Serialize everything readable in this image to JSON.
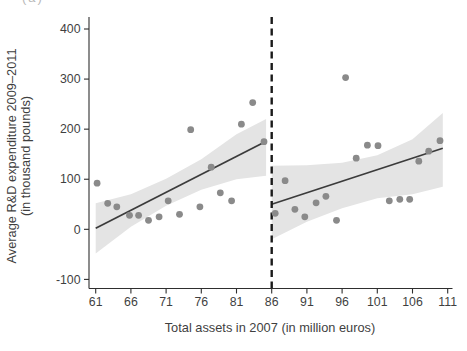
{
  "figure": {
    "panel_label": "(a)"
  },
  "chart_data": {
    "type": "scatter",
    "title": "",
    "xlabel": "Total assets in 2007 (in million euros)",
    "ylabel_line1": "Average R&D expenditure 2009–2011",
    "ylabel_line2": "(in thousand pounds)",
    "xlim": [
      61,
      111
    ],
    "ylim": [
      -100,
      400
    ],
    "x_ticks": [
      61,
      66,
      71,
      76,
      81,
      86,
      91,
      96,
      101,
      106,
      111
    ],
    "y_ticks": [
      400,
      300,
      200,
      100,
      0,
      -100
    ],
    "grid": false,
    "legend": "none",
    "cutoff_x": 86,
    "series": [
      {
        "name": "firms-below-cutoff",
        "points": [
          [
            61.2,
            92
          ],
          [
            62.7,
            52
          ],
          [
            64.0,
            45
          ],
          [
            65.8,
            28
          ],
          [
            67.1,
            28
          ],
          [
            68.5,
            18
          ],
          [
            70.0,
            25
          ],
          [
            71.3,
            57
          ],
          [
            72.9,
            30
          ],
          [
            74.5,
            199
          ],
          [
            75.8,
            45
          ],
          [
            77.4,
            124
          ],
          [
            78.7,
            73
          ],
          [
            80.3,
            57
          ],
          [
            81.7,
            210
          ],
          [
            83.3,
            253
          ],
          [
            84.9,
            175
          ]
        ]
      },
      {
        "name": "firms-above-cutoff",
        "points": [
          [
            86.5,
            32
          ],
          [
            87.9,
            97
          ],
          [
            89.3,
            40
          ],
          [
            90.7,
            25
          ],
          [
            92.3,
            53
          ],
          [
            93.7,
            66
          ],
          [
            95.2,
            18
          ],
          [
            96.5,
            303
          ],
          [
            98.0,
            142
          ],
          [
            99.6,
            168
          ],
          [
            101.1,
            167
          ],
          [
            102.7,
            57
          ],
          [
            104.2,
            60
          ],
          [
            105.6,
            60
          ],
          [
            106.9,
            136
          ],
          [
            108.3,
            156
          ],
          [
            109.9,
            177
          ]
        ]
      }
    ],
    "fit_lines": [
      {
        "name": "fit-below-cutoff",
        "x1": 61,
        "y1": 2,
        "x2": 84.8,
        "y2": 173
      },
      {
        "name": "fit-above-cutoff",
        "x1": 86,
        "y1": 50,
        "x2": 110.3,
        "y2": 162
      }
    ],
    "confidence_bands": [
      {
        "name": "band-below-cutoff",
        "x": [
          61,
          66,
          71,
          76,
          81,
          85.2
        ],
        "top": [
          52,
          70,
          101,
          140,
          190,
          220
        ],
        "bottom": [
          -48,
          5,
          47,
          79,
          100,
          107
        ]
      },
      {
        "name": "band-above-cutoff",
        "x": [
          86,
          91,
          96,
          101,
          106,
          110.3
        ],
        "top": [
          127,
          128,
          133,
          148,
          180,
          232
        ],
        "bottom": [
          -20,
          15,
          42,
          62,
          70,
          85
        ]
      }
    ],
    "colors": {
      "band": "#e4e4e4",
      "point": "#8a8a8a",
      "fit_line": "#3b3b3b",
      "cutoff_line": "#1a1a1a",
      "axis": "#2e2e2e",
      "text": "#3f3f3f",
      "background": "#ffffff"
    }
  }
}
